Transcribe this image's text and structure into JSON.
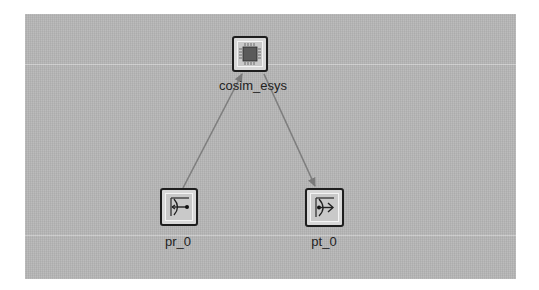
{
  "diagram": {
    "background_color": "#b5b5b5",
    "edge_color": "#7a7a7a",
    "nodes": [
      {
        "id": "cosim_esys",
        "label": "cosim_esys",
        "icon": "chip-icon"
      },
      {
        "id": "pr_0",
        "label": "pr_0",
        "icon": "port-receive-icon"
      },
      {
        "id": "pt_0",
        "label": "pt_0",
        "icon": "port-transmit-icon"
      }
    ],
    "edges": [
      {
        "from": "pr_0",
        "to": "cosim_esys"
      },
      {
        "from": "cosim_esys",
        "to": "pt_0"
      }
    ]
  }
}
